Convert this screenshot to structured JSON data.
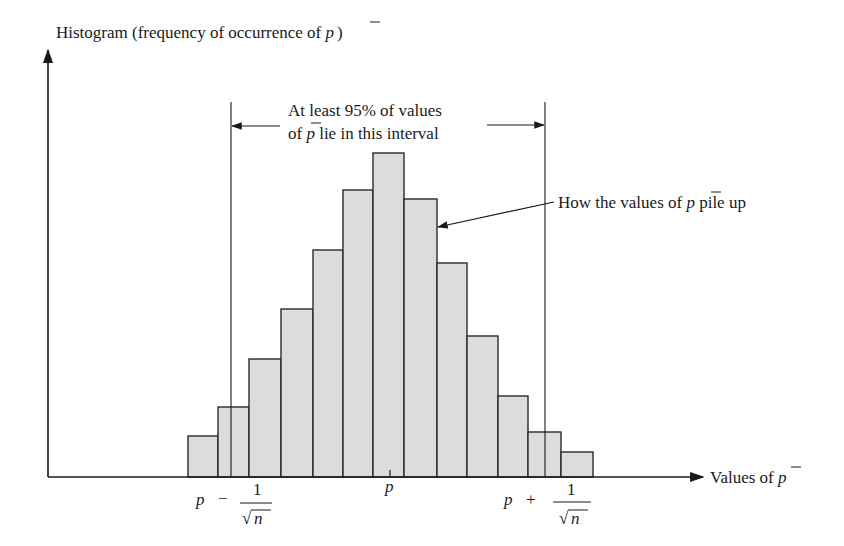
{
  "y_axis_label": {
    "prefix": "Histogram (frequency of occurrence of ",
    "var": "p",
    "suffix": ")"
  },
  "x_axis_label": {
    "prefix": "Values of ",
    "var": "p"
  },
  "interval_annotation": {
    "line1": "At least 95% of values",
    "line2_prefix": "of ",
    "line2_var": "p",
    "line2_suffix": " lie in this interval"
  },
  "pile_annotation": {
    "prefix": "How the values of ",
    "var": "p",
    "suffix": " pile up"
  },
  "x_ticks": {
    "left": {
      "p": "p",
      "op": "−",
      "num": "1",
      "den": "n"
    },
    "center": "p",
    "right": {
      "p": "p",
      "op": "+",
      "num": "1",
      "den": "n"
    }
  },
  "colors": {
    "bar_fill": "#dcdcdc",
    "bar_stroke": "#2a2a2a",
    "ink": "#1a1a1a"
  },
  "chart_data": {
    "type": "bar",
    "title": "",
    "xlabel": "Values of p̄",
    "ylabel": "Histogram (frequency of occurrence of p̄)",
    "categories": [
      "b1",
      "b2",
      "b3",
      "b4",
      "b5",
      "b6",
      "b7",
      "b8",
      "b9",
      "b10",
      "b11",
      "b12",
      "b13"
    ],
    "values": [
      38,
      67,
      115,
      165,
      224,
      284,
      321,
      275,
      211,
      138,
      78,
      42,
      22
    ],
    "bins_px": [
      [
        188,
        218
      ],
      [
        218,
        249
      ],
      [
        249,
        281
      ],
      [
        281,
        313
      ],
      [
        313,
        343
      ],
      [
        343,
        373
      ],
      [
        373,
        404
      ],
      [
        404,
        437
      ],
      [
        437,
        467
      ],
      [
        467,
        498
      ],
      [
        498,
        528
      ],
      [
        528,
        561
      ],
      [
        561,
        593
      ]
    ],
    "baseline_px": 474,
    "interval_left_px": 231,
    "interval_right_px": 545,
    "center_tick_px": 390,
    "ylim": [
      0,
      330
    ]
  }
}
